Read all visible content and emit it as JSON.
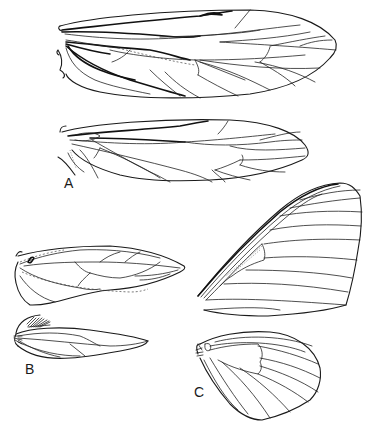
{
  "figure": {
    "panels": [
      {
        "id": "A",
        "label": "A",
        "content": "elongate forewing (top) and hindwing (below) with dense longitudinal venation and crossveins"
      },
      {
        "id": "B",
        "label": "B",
        "content": "small forewing with dashed veins and narrow hindwing with basal fringe of hairs"
      },
      {
        "id": "C",
        "label": "C",
        "content": "broad triangular forewing with thickened costal margin and rounded hindwing with discal cell"
      }
    ]
  },
  "colors": {
    "line": "#1a1a1a",
    "background": "#ffffff"
  }
}
